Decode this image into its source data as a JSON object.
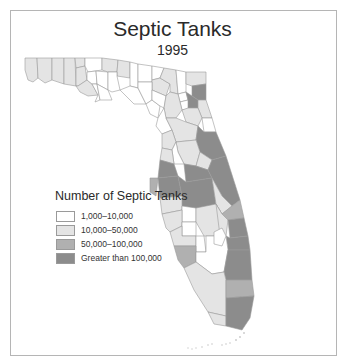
{
  "title": "Septic Tanks",
  "subtitle": "1995",
  "legend": {
    "title": "Number of Septic Tanks",
    "items": [
      {
        "label": "1,000–10,000",
        "color": "#ffffff"
      },
      {
        "label": "10,000–50,000",
        "color": "#e4e4e4"
      },
      {
        "label": "50,000–100,000",
        "color": "#b0b0b0"
      },
      {
        "label": "Greater than 100,000",
        "color": "#8c8c8c"
      }
    ]
  },
  "colors": {
    "class1": "#ffffff",
    "class2": "#e4e4e4",
    "class3": "#b0b0b0",
    "class4": "#8c8c8c",
    "border": "#9a9a9a",
    "frame": "#b5b5b5"
  }
}
